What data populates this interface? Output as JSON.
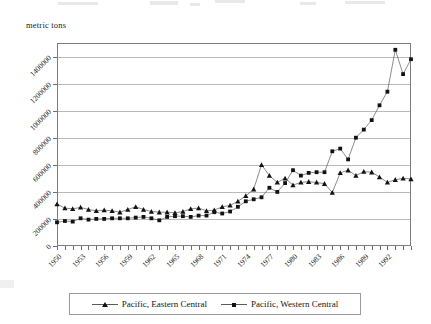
{
  "axis_title": "metric tons",
  "legend": {
    "items": [
      {
        "label": "Pacific, Eastern Central",
        "marker": "triangle-marker-icon"
      },
      {
        "label": "Pacific, Western Central",
        "marker": "square-marker-icon"
      }
    ]
  },
  "colors": {
    "series_line": "#5a5a5a",
    "marker": "#121212",
    "gridline": "#b9b9b9",
    "frame": "#7d7d7d",
    "background": "#ffffff"
  },
  "chart_data": {
    "type": "line",
    "title": "",
    "xlabel": "",
    "ylabel": "metric tons",
    "ylim": [
      0,
      1500000
    ],
    "xlim": [
      1950,
      1995
    ],
    "grid": true,
    "legend_position": "bottom",
    "ytick_labels": [
      "0",
      "200000",
      "400000",
      "600000",
      "800000",
      "1000000",
      "1200000",
      "1400000"
    ],
    "ytick_values": [
      0,
      200000,
      400000,
      600000,
      800000,
      1000000,
      1200000,
      1400000
    ],
    "xtick_labels": [
      "1950",
      "1953",
      "1956",
      "1959",
      "1962",
      "1965",
      "1968",
      "1971",
      "1974",
      "1977",
      "1980",
      "1983",
      "1986",
      "1989",
      "1992"
    ],
    "xtick_values": [
      1950,
      1953,
      1956,
      1959,
      1962,
      1965,
      1968,
      1971,
      1974,
      1977,
      1980,
      1983,
      1986,
      1989,
      1992
    ],
    "x": [
      1950,
      1951,
      1952,
      1953,
      1954,
      1955,
      1956,
      1957,
      1958,
      1959,
      1960,
      1961,
      1962,
      1963,
      1964,
      1965,
      1966,
      1967,
      1968,
      1969,
      1970,
      1971,
      1972,
      1973,
      1974,
      1975,
      1976,
      1977,
      1978,
      1979,
      1980,
      1981,
      1982,
      1983,
      1984,
      1985,
      1986,
      1987,
      1988,
      1989,
      1990,
      1991,
      1992,
      1993,
      1994,
      1995
    ],
    "series": [
      {
        "name": "Pacific, Eastern Central",
        "marker": "triangle",
        "values": [
          310000,
          280000,
          275000,
          285000,
          270000,
          260000,
          265000,
          260000,
          250000,
          270000,
          290000,
          270000,
          255000,
          250000,
          250000,
          245000,
          255000,
          275000,
          280000,
          260000,
          265000,
          290000,
          300000,
          330000,
          370000,
          420000,
          600000,
          520000,
          470000,
          500000,
          450000,
          470000,
          475000,
          470000,
          460000,
          395000,
          540000,
          560000,
          520000,
          550000,
          545000,
          510000,
          470000,
          490000,
          500000,
          495000
        ]
      },
      {
        "name": "Pacific, Western Central",
        "marker": "square",
        "values": [
          175000,
          185000,
          180000,
          205000,
          195000,
          200000,
          200000,
          205000,
          205000,
          205000,
          210000,
          215000,
          205000,
          190000,
          215000,
          220000,
          220000,
          215000,
          225000,
          225000,
          250000,
          240000,
          255000,
          290000,
          330000,
          345000,
          360000,
          430000,
          400000,
          465000,
          560000,
          520000,
          540000,
          545000,
          545000,
          700000,
          720000,
          640000,
          800000,
          860000,
          930000,
          1040000,
          1140000,
          1450000,
          1270000,
          1380000
        ]
      }
    ]
  }
}
